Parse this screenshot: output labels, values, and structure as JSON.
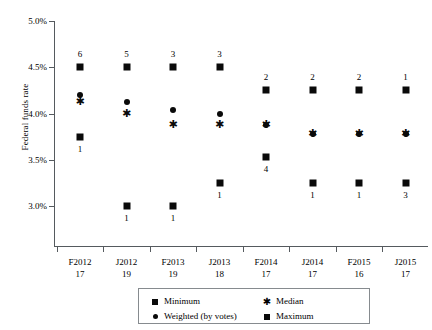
{
  "chart_data": {
    "type": "scatter",
    "title": "",
    "xlabel": "",
    "ylabel": "Federal funds rate",
    "ylim": [
      2.75,
      5.0
    ],
    "yticks": [
      "3.0%",
      "3.5%",
      "4.0%",
      "4.5%",
      "5.0%"
    ],
    "ytick_values": [
      3.0,
      3.5,
      4.0,
      4.5,
      5.0
    ],
    "grid": false,
    "legend_position": "bottom-center",
    "categories": [
      "F2012",
      "J2012",
      "F2013",
      "J2013",
      "F2014",
      "J2014",
      "F2015",
      "J2015"
    ],
    "category_sublabels": [
      "17",
      "19",
      "19",
      "18",
      "17",
      "17",
      "16",
      "17"
    ],
    "series": [
      {
        "name": "Maximum",
        "marker": "square",
        "values": [
          4.5,
          4.5,
          4.5,
          4.5,
          4.25,
          4.25,
          4.25,
          4.25
        ],
        "count_labels": [
          "6",
          "5",
          "3",
          "3",
          "2",
          "2",
          "2",
          "1"
        ]
      },
      {
        "name": "Weighted (by votes)",
        "marker": "circle",
        "values": [
          4.2,
          4.12,
          4.04,
          4.0,
          3.88,
          3.78,
          3.78,
          3.78
        ],
        "count_labels": [
          "",
          "",
          "",
          "",
          "",
          "",
          "",
          ""
        ]
      },
      {
        "name": "Median",
        "marker": "star",
        "values": [
          4.12,
          4.0,
          3.88,
          3.88,
          3.88,
          3.78,
          3.78,
          3.78
        ],
        "count_labels": [
          "",
          "",
          "",
          "",
          "",
          "",
          "",
          ""
        ]
      },
      {
        "name": "Minimum",
        "marker": "square",
        "values": [
          3.75,
          3.0,
          3.0,
          3.25,
          3.53,
          3.25,
          3.25,
          3.25
        ],
        "count_labels": [
          "1",
          "1",
          "1",
          "1",
          "4",
          "1",
          "1",
          "3"
        ]
      }
    ]
  },
  "axis": {
    "y_title": "Federal funds rate"
  },
  "legend": {
    "entries": [
      {
        "label": "Minimum",
        "marker": "square"
      },
      {
        "label": "Median",
        "marker": "star"
      },
      {
        "label": "Weighted (by votes)",
        "marker": "circle"
      },
      {
        "label": "Maximum",
        "marker": "square"
      }
    ]
  },
  "colors": {
    "marker": "#0a0a0a",
    "axis": "#555a5e",
    "legend_border": "#868b8f",
    "background": "#ffffff"
  }
}
